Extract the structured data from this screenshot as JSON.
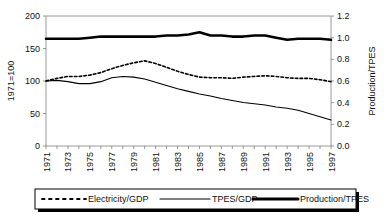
{
  "chart_data": {
    "type": "line",
    "title": "",
    "xlabel": "",
    "ylabel": "1971=100",
    "y2label": "Production/TPES",
    "grid": false,
    "legend_position": "bottom",
    "x": [
      1971,
      1972,
      1973,
      1974,
      1975,
      1976,
      1977,
      1978,
      1979,
      1980,
      1981,
      1982,
      1983,
      1984,
      1985,
      1986,
      1987,
      1988,
      1989,
      1990,
      1991,
      1992,
      1993,
      1994,
      1995,
      1996,
      1997
    ],
    "xticklabels": [
      "1971",
      "1973",
      "1975",
      "1977",
      "1979",
      "1981",
      "1983",
      "1985",
      "1987",
      "1989",
      "1991",
      "1993",
      "1995",
      "1997"
    ],
    "xtick_years": [
      1971,
      1973,
      1975,
      1977,
      1979,
      1981,
      1983,
      1985,
      1987,
      1989,
      1991,
      1993,
      1995,
      1997
    ],
    "ylim": [
      0,
      200
    ],
    "yticks": [
      0,
      50,
      100,
      150,
      200
    ],
    "yticklabels": [
      "0",
      "50",
      "100",
      "150",
      "200"
    ],
    "y2lim": [
      0.0,
      1.2
    ],
    "y2ticks": [
      0.0,
      0.2,
      0.4,
      0.6,
      0.8,
      1.0,
      1.2
    ],
    "y2ticklabels": [
      "0.0",
      "0.2",
      "0.4",
      "0.6",
      "0.8",
      "1.0",
      "1.2"
    ],
    "series": [
      {
        "name": "Electricity/GDP",
        "axis": "left",
        "style": "dashed",
        "color": "#000000",
        "values": [
          100,
          104,
          107,
          107,
          109,
          113,
          119,
          124,
          128,
          131,
          127,
          121,
          115,
          110,
          106,
          105,
          105,
          104,
          106,
          107,
          108,
          107,
          105,
          104,
          104,
          102,
          99
        ]
      },
      {
        "name": "TPES/GDP",
        "axis": "left",
        "style": "solid-thin",
        "color": "#000000",
        "values": [
          100,
          101,
          99,
          96,
          96,
          99,
          105,
          107,
          106,
          103,
          98,
          93,
          88,
          84,
          80,
          77,
          73,
          70,
          67,
          65,
          63,
          60,
          58,
          55,
          50,
          45,
          40
        ]
      },
      {
        "name": "Production/TPES",
        "axis": "right",
        "style": "solid-thick",
        "color": "#000000",
        "values": [
          0.99,
          0.99,
          0.99,
          0.99,
          1.0,
          1.01,
          1.01,
          1.01,
          1.01,
          1.01,
          1.01,
          1.02,
          1.02,
          1.03,
          1.05,
          1.02,
          1.02,
          1.01,
          1.01,
          1.02,
          1.02,
          1.0,
          0.98,
          0.99,
          0.99,
          0.99,
          0.98
        ]
      }
    ],
    "legend": [
      {
        "label": "Electricity/GDP",
        "style": "dashed"
      },
      {
        "label": "TPES/GDP",
        "style": "solid-thin"
      },
      {
        "label": "Production/TPES",
        "style": "solid-thick"
      }
    ]
  }
}
